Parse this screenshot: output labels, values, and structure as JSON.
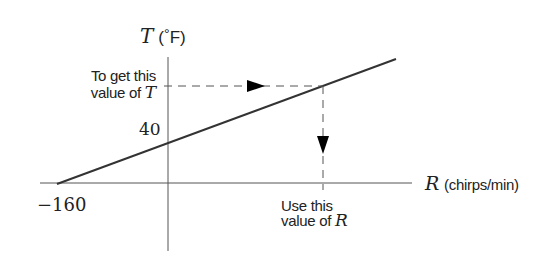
{
  "diagram": {
    "y_axis": {
      "symbol": "T",
      "unit_open": "(",
      "degree": "°",
      "unit": "F)"
    },
    "x_axis": {
      "symbol": "R",
      "unit": "(chirps/min)"
    },
    "tick_labels": {
      "y_intercept": "40",
      "x_intercept": "−160"
    },
    "annotations": {
      "get_t_line1": "To get this",
      "get_t_line2_text": "value of",
      "get_t_line2_symbol": "T",
      "use_r_line1": "Use this",
      "use_r_line2_text": "value of",
      "use_r_line2_symbol": "R"
    },
    "colors": {
      "axis": "#555555",
      "line": "#333333",
      "dashed": "#555555",
      "arrow": "#000000",
      "text": "#222222"
    }
  }
}
